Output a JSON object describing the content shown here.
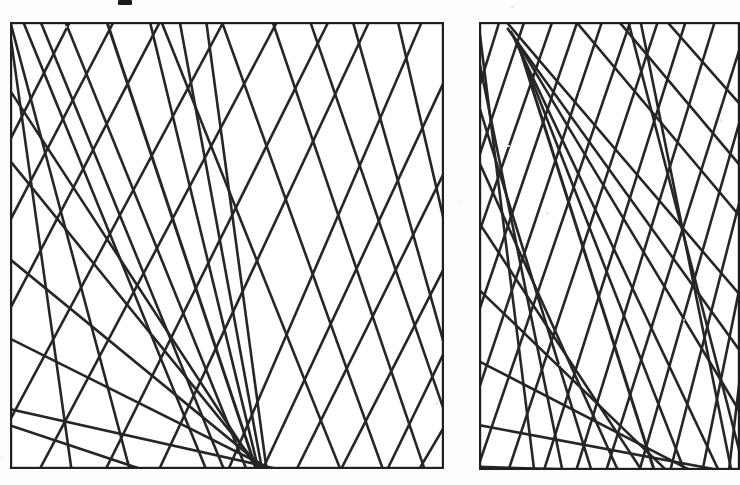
{
  "figure": {
    "kind": "line-arrangement-figure",
    "background_color": "#fdfdfd",
    "ink_color": "#262626",
    "panel_border_color": "#1f1f1f",
    "caption_text": "",
    "artifact_mark": {
      "name": "page-edge-artifact",
      "x": 118,
      "y": 0,
      "width": 14,
      "height": 5,
      "color": "#1a1a1a"
    },
    "panels": [
      {
        "id": "left",
        "label": "",
        "x": 10,
        "y": 22,
        "width": 434,
        "height": 447,
        "border_width": 2.2,
        "line_count": 34,
        "line_width": 2.6
      },
      {
        "id": "right",
        "label": "",
        "x": 479,
        "y": 22,
        "width": 261,
        "height": 448,
        "border_width": 2.2,
        "line_count": 34,
        "line_width": 2.6
      }
    ]
  },
  "chart_data": {
    "type": "scatter",
    "title": "",
    "subtitle": "",
    "xlabel": "",
    "ylabel": "",
    "grid": false,
    "legend": "none",
    "panels": [
      {
        "id": "left",
        "xlim": [
          0,
          434
        ],
        "ylim": [
          0,
          447
        ],
        "note": "coordinates are in panel-local pixels, origin top-left; each line is given by two endpoints on the frame boundary",
        "lines": [
          {
            "name": "L1",
            "x1": 0,
            "y1": 6,
            "x2": 62,
            "y2": 447,
            "weight": 2.6
          },
          {
            "name": "L2",
            "x1": 0,
            "y1": 0,
            "x2": 120,
            "y2": 447,
            "weight": 2.6
          },
          {
            "name": "L3",
            "x1": 14,
            "y1": 0,
            "x2": 196,
            "y2": 447,
            "weight": 2.6
          },
          {
            "name": "L4",
            "x1": 30,
            "y1": 0,
            "x2": 214,
            "y2": 447,
            "weight": 2.6
          },
          {
            "name": "L5",
            "x1": 56,
            "y1": 0,
            "x2": 237,
            "y2": 447,
            "weight": 2.6
          },
          {
            "name": "L6",
            "x1": 96,
            "y1": 0,
            "x2": 246,
            "y2": 447,
            "weight": 3.0
          },
          {
            "name": "L7",
            "x1": 140,
            "y1": 0,
            "x2": 248,
            "y2": 447,
            "weight": 2.6
          },
          {
            "name": "L8",
            "x1": 170,
            "y1": 0,
            "x2": 252,
            "y2": 447,
            "weight": 2.6
          },
          {
            "name": "L9",
            "x1": 196,
            "y1": 0,
            "x2": 256,
            "y2": 447,
            "weight": 2.6
          },
          {
            "name": "L10",
            "x1": 150,
            "y1": 0,
            "x2": 330,
            "y2": 447,
            "weight": 2.6
          },
          {
            "name": "L11",
            "x1": 212,
            "y1": 0,
            "x2": 372,
            "y2": 447,
            "weight": 2.6
          },
          {
            "name": "L12",
            "x1": 262,
            "y1": 0,
            "x2": 414,
            "y2": 447,
            "weight": 2.6
          },
          {
            "name": "L13",
            "x1": 300,
            "y1": 0,
            "x2": 434,
            "y2": 392,
            "weight": 2.6
          },
          {
            "name": "L14",
            "x1": 344,
            "y1": 0,
            "x2": 434,
            "y2": 318,
            "weight": 2.6
          },
          {
            "name": "L15",
            "x1": 388,
            "y1": 0,
            "x2": 434,
            "y2": 196,
            "weight": 2.6
          },
          {
            "name": "L16",
            "x1": 0,
            "y1": 70,
            "x2": 248,
            "y2": 447,
            "weight": 2.6
          },
          {
            "name": "L17",
            "x1": 0,
            "y1": 140,
            "x2": 252,
            "y2": 447,
            "weight": 2.6
          },
          {
            "name": "L18",
            "x1": 0,
            "y1": 236,
            "x2": 256,
            "y2": 447,
            "weight": 2.6
          },
          {
            "name": "L19",
            "x1": 0,
            "y1": 318,
            "x2": 260,
            "y2": 447,
            "weight": 2.6
          },
          {
            "name": "L20",
            "x1": 0,
            "y1": 388,
            "x2": 264,
            "y2": 447,
            "weight": 2.6
          },
          {
            "name": "L21",
            "x1": 60,
            "y1": 0,
            "x2": 0,
            "y2": 116,
            "weight": 2.6
          },
          {
            "name": "L22",
            "x1": 104,
            "y1": 0,
            "x2": 0,
            "y2": 200,
            "weight": 2.6
          },
          {
            "name": "L23",
            "x1": 150,
            "y1": 0,
            "x2": 0,
            "y2": 286,
            "weight": 2.6
          },
          {
            "name": "L24",
            "x1": 214,
            "y1": 0,
            "x2": 0,
            "y2": 400,
            "weight": 2.6
          },
          {
            "name": "L25",
            "x1": 268,
            "y1": 0,
            "x2": 30,
            "y2": 447,
            "weight": 2.6
          },
          {
            "name": "L26",
            "x1": 318,
            "y1": 0,
            "x2": 96,
            "y2": 447,
            "weight": 2.6
          },
          {
            "name": "L27",
            "x1": 360,
            "y1": 0,
            "x2": 150,
            "y2": 447,
            "weight": 2.6
          },
          {
            "name": "L28",
            "x1": 412,
            "y1": 0,
            "x2": 218,
            "y2": 447,
            "weight": 2.6
          },
          {
            "name": "L29",
            "x1": 434,
            "y1": 60,
            "x2": 252,
            "y2": 447,
            "weight": 2.6
          },
          {
            "name": "L30",
            "x1": 434,
            "y1": 150,
            "x2": 286,
            "y2": 447,
            "weight": 2.6
          },
          {
            "name": "L31",
            "x1": 434,
            "y1": 246,
            "x2": 330,
            "y2": 447,
            "weight": 2.6
          },
          {
            "name": "L32",
            "x1": 434,
            "y1": 332,
            "x2": 378,
            "y2": 447,
            "weight": 2.6
          },
          {
            "name": "L33",
            "x1": 434,
            "y1": 404,
            "x2": 410,
            "y2": 447,
            "weight": 2.6
          },
          {
            "name": "L34",
            "x1": 0,
            "y1": 404,
            "x2": 130,
            "y2": 447,
            "weight": 2.6
          }
        ]
      },
      {
        "id": "right",
        "xlim": [
          0,
          261
        ],
        "ylim": [
          0,
          448
        ],
        "note": "coordinates are in panel-local pixels, origin top-left; right edge is clipped by the image boundary",
        "lines": [
          {
            "name": "R1",
            "x1": 0,
            "y1": 4,
            "x2": 56,
            "y2": 448,
            "weight": 2.6
          },
          {
            "name": "R2",
            "x1": 0,
            "y1": 36,
            "x2": 84,
            "y2": 448,
            "weight": 2.6
          },
          {
            "name": "R3",
            "x1": 0,
            "y1": 84,
            "x2": 112,
            "y2": 448,
            "weight": 2.6
          },
          {
            "name": "R4",
            "x1": 0,
            "y1": 140,
            "x2": 140,
            "y2": 448,
            "weight": 2.6
          },
          {
            "name": "R5",
            "x1": 0,
            "y1": 200,
            "x2": 164,
            "y2": 448,
            "weight": 2.6
          },
          {
            "name": "R6",
            "x1": 0,
            "y1": 268,
            "x2": 188,
            "y2": 448,
            "weight": 2.6
          },
          {
            "name": "R7",
            "x1": 0,
            "y1": 340,
            "x2": 212,
            "y2": 448,
            "weight": 2.6
          },
          {
            "name": "R8",
            "x1": 0,
            "y1": 404,
            "x2": 236,
            "y2": 448,
            "weight": 2.6
          },
          {
            "name": "R9",
            "x1": 20,
            "y1": 0,
            "x2": 0,
            "y2": 64,
            "weight": 2.6
          },
          {
            "name": "R10",
            "x1": 46,
            "y1": 0,
            "x2": 0,
            "y2": 136,
            "weight": 2.6
          },
          {
            "name": "R11",
            "x1": 72,
            "y1": 0,
            "x2": 0,
            "y2": 212,
            "weight": 2.6
          },
          {
            "name": "R12",
            "x1": 98,
            "y1": 0,
            "x2": 0,
            "y2": 290,
            "weight": 2.6
          },
          {
            "name": "R13",
            "x1": 124,
            "y1": 0,
            "x2": 0,
            "y2": 368,
            "weight": 2.6
          },
          {
            "name": "R14",
            "x1": 150,
            "y1": 0,
            "x2": 0,
            "y2": 444,
            "weight": 2.6
          },
          {
            "name": "R15",
            "x1": 178,
            "y1": 0,
            "x2": 30,
            "y2": 448,
            "weight": 2.6
          },
          {
            "name": "R16",
            "x1": 206,
            "y1": 0,
            "x2": 64,
            "y2": 448,
            "weight": 2.6
          },
          {
            "name": "R17",
            "x1": 236,
            "y1": 0,
            "x2": 96,
            "y2": 448,
            "weight": 2.6
          },
          {
            "name": "R18",
            "x1": 261,
            "y1": 22,
            "x2": 128,
            "y2": 448,
            "weight": 2.6
          },
          {
            "name": "R19",
            "x1": 261,
            "y1": 96,
            "x2": 160,
            "y2": 448,
            "weight": 2.6
          },
          {
            "name": "R20",
            "x1": 261,
            "y1": 176,
            "x2": 192,
            "y2": 448,
            "weight": 2.6
          },
          {
            "name": "R21",
            "x1": 261,
            "y1": 262,
            "x2": 224,
            "y2": 448,
            "weight": 2.6
          },
          {
            "name": "R22",
            "x1": 261,
            "y1": 352,
            "x2": 250,
            "y2": 448,
            "weight": 2.6
          },
          {
            "name": "R23",
            "x1": 26,
            "y1": 0,
            "x2": 261,
            "y2": 274,
            "weight": 2.6
          },
          {
            "name": "R24",
            "x1": 30,
            "y1": 6,
            "x2": 261,
            "y2": 330,
            "weight": 2.6
          },
          {
            "name": "R25",
            "x1": 32,
            "y1": 10,
            "x2": 261,
            "y2": 388,
            "weight": 2.6
          },
          {
            "name": "R26",
            "x1": 34,
            "y1": 14,
            "x2": 240,
            "y2": 448,
            "weight": 2.6
          },
          {
            "name": "R27",
            "x1": 36,
            "y1": 18,
            "x2": 206,
            "y2": 448,
            "weight": 2.6
          },
          {
            "name": "R28",
            "x1": 38,
            "y1": 22,
            "x2": 176,
            "y2": 448,
            "weight": 3.0
          },
          {
            "name": "R29",
            "x1": 96,
            "y1": 0,
            "x2": 261,
            "y2": 196,
            "weight": 2.6
          },
          {
            "name": "R30",
            "x1": 140,
            "y1": 0,
            "x2": 261,
            "y2": 142,
            "weight": 2.6
          },
          {
            "name": "R31",
            "x1": 188,
            "y1": 0,
            "x2": 261,
            "y2": 84,
            "weight": 2.6
          },
          {
            "name": "R32",
            "x1": 150,
            "y1": 0,
            "x2": 261,
            "y2": 430,
            "weight": 2.6
          },
          {
            "name": "R33",
            "x1": 162,
            "y1": 0,
            "x2": 252,
            "y2": 448,
            "weight": 2.6
          },
          {
            "name": "R34",
            "x1": 0,
            "y1": 444,
            "x2": 92,
            "y2": 448,
            "weight": 2.6
          }
        ]
      }
    ]
  }
}
